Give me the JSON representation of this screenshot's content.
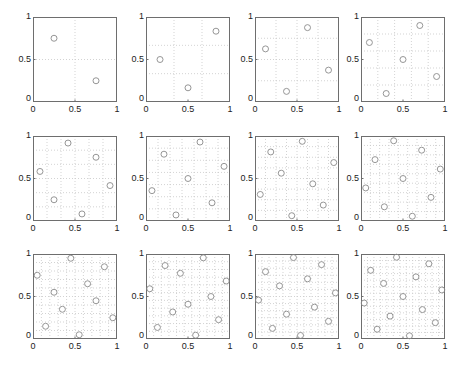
{
  "chart_data": [
    {
      "type": "scatter",
      "n": 2,
      "xlim": [
        0,
        1
      ],
      "ylim": [
        0,
        1
      ],
      "grid": true,
      "xticks": [
        "0",
        "0.5",
        "1"
      ],
      "yticks": [
        "0",
        "0.5",
        "1"
      ],
      "points": [
        [
          0.25,
          0.75
        ],
        [
          0.75,
          0.25
        ]
      ]
    },
    {
      "type": "scatter",
      "n": 3,
      "xlim": [
        0,
        1
      ],
      "ylim": [
        0,
        1
      ],
      "grid": true,
      "xticks": [
        "0",
        "0.5",
        "1"
      ],
      "yticks": [
        "0",
        "0.5",
        "1"
      ],
      "points": [
        [
          0.167,
          0.5
        ],
        [
          0.5,
          0.167
        ],
        [
          0.833,
          0.833
        ]
      ]
    },
    {
      "type": "scatter",
      "n": 4,
      "xlim": [
        0,
        1
      ],
      "ylim": [
        0,
        1
      ],
      "grid": true,
      "xticks": [
        "0",
        "0.5",
        "1"
      ],
      "yticks": [
        "0",
        "0.5",
        "1"
      ],
      "points": [
        [
          0.125,
          0.625
        ],
        [
          0.375,
          0.125
        ],
        [
          0.625,
          0.875
        ],
        [
          0.875,
          0.375
        ]
      ]
    },
    {
      "type": "scatter",
      "n": 5,
      "xlim": [
        0,
        1
      ],
      "ylim": [
        0,
        1
      ],
      "grid": true,
      "xticks": [
        "0",
        "0.5",
        "1"
      ],
      "yticks": [
        "0",
        "0.5",
        "1"
      ],
      "points": [
        [
          0.1,
          0.7
        ],
        [
          0.3,
          0.1
        ],
        [
          0.5,
          0.5
        ],
        [
          0.7,
          0.9
        ],
        [
          0.9,
          0.3
        ]
      ]
    },
    {
      "type": "scatter",
      "n": 6,
      "xlim": [
        0,
        1
      ],
      "ylim": [
        0,
        1
      ],
      "grid": true,
      "xticks": [
        "0",
        "0.5",
        "1"
      ],
      "yticks": [
        "0",
        "0.5",
        "1"
      ],
      "points": [
        [
          0.083,
          0.583
        ],
        [
          0.25,
          0.25
        ],
        [
          0.417,
          0.917
        ],
        [
          0.583,
          0.083
        ],
        [
          0.75,
          0.75
        ],
        [
          0.917,
          0.417
        ]
      ]
    },
    {
      "type": "scatter",
      "n": 7,
      "xlim": [
        0,
        1
      ],
      "ylim": [
        0,
        1
      ],
      "grid": true,
      "xticks": [
        "0",
        "0.5",
        "1"
      ],
      "yticks": [
        "0",
        "0.5",
        "1"
      ],
      "points": [
        [
          0.071,
          0.357
        ],
        [
          0.214,
          0.786
        ],
        [
          0.357,
          0.071
        ],
        [
          0.5,
          0.5
        ],
        [
          0.643,
          0.929
        ],
        [
          0.786,
          0.214
        ],
        [
          0.929,
          0.643
        ]
      ]
    },
    {
      "type": "scatter",
      "n": 8,
      "xlim": [
        0,
        1
      ],
      "ylim": [
        0,
        1
      ],
      "grid": true,
      "xticks": [
        "0",
        "0.5",
        "1"
      ],
      "yticks": [
        "0",
        "0.5",
        "1"
      ],
      "points": [
        [
          0.0625,
          0.3125
        ],
        [
          0.1875,
          0.8125
        ],
        [
          0.3125,
          0.5625
        ],
        [
          0.4375,
          0.0625
        ],
        [
          0.5625,
          0.9375
        ],
        [
          0.6875,
          0.4375
        ],
        [
          0.8125,
          0.1875
        ],
        [
          0.9375,
          0.6875
        ]
      ]
    },
    {
      "type": "scatter",
      "n": 9,
      "xlim": [
        0,
        1
      ],
      "ylim": [
        0,
        1
      ],
      "grid": true,
      "xticks": [
        "0",
        "0.5",
        "1"
      ],
      "yticks": [
        "0",
        "0.5",
        "1"
      ],
      "points": [
        [
          0.056,
          0.389
        ],
        [
          0.167,
          0.722
        ],
        [
          0.278,
          0.167
        ],
        [
          0.389,
          0.944
        ],
        [
          0.5,
          0.5
        ],
        [
          0.611,
          0.056
        ],
        [
          0.722,
          0.833
        ],
        [
          0.833,
          0.278
        ],
        [
          0.944,
          0.611
        ]
      ]
    },
    {
      "type": "scatter",
      "n": 10,
      "xlim": [
        0,
        1
      ],
      "ylim": [
        0,
        1
      ],
      "grid": true,
      "xticks": [
        "0",
        "0.5",
        "1"
      ],
      "yticks": [
        "0",
        "0.5",
        "1"
      ],
      "points": [
        [
          0.05,
          0.75
        ],
        [
          0.15,
          0.15
        ],
        [
          0.25,
          0.55
        ],
        [
          0.35,
          0.35
        ],
        [
          0.45,
          0.95
        ],
        [
          0.55,
          0.05
        ],
        [
          0.65,
          0.65
        ],
        [
          0.75,
          0.45
        ],
        [
          0.85,
          0.85
        ],
        [
          0.95,
          0.25
        ]
      ]
    },
    {
      "type": "scatter",
      "n": 11,
      "xlim": [
        0,
        1
      ],
      "ylim": [
        0,
        1
      ],
      "grid": true,
      "xticks": [
        "0",
        "0.5",
        "1"
      ],
      "yticks": [
        "0",
        "0.5",
        "1"
      ],
      "points": [
        [
          0.045,
          0.591
        ],
        [
          0.136,
          0.136
        ],
        [
          0.227,
          0.864
        ],
        [
          0.318,
          0.318
        ],
        [
          0.409,
          0.773
        ],
        [
          0.5,
          0.409
        ],
        [
          0.591,
          0.045
        ],
        [
          0.682,
          0.955
        ],
        [
          0.773,
          0.5
        ],
        [
          0.864,
          0.227
        ],
        [
          0.955,
          0.682
        ]
      ]
    },
    {
      "type": "scatter",
      "n": 12,
      "xlim": [
        0,
        1
      ],
      "ylim": [
        0,
        1
      ],
      "grid": true,
      "xticks": [
        "0",
        "0.5",
        "1"
      ],
      "yticks": [
        "0",
        "0.5",
        "1"
      ],
      "points": [
        [
          0.042,
          0.458
        ],
        [
          0.125,
          0.792
        ],
        [
          0.208,
          0.125
        ],
        [
          0.292,
          0.625
        ],
        [
          0.375,
          0.292
        ],
        [
          0.458,
          0.958
        ],
        [
          0.542,
          0.042
        ],
        [
          0.625,
          0.708
        ],
        [
          0.708,
          0.375
        ],
        [
          0.792,
          0.875
        ],
        [
          0.875,
          0.208
        ],
        [
          0.958,
          0.542
        ]
      ]
    },
    {
      "type": "scatter",
      "n": 13,
      "xlim": [
        0,
        1
      ],
      "ylim": [
        0,
        1
      ],
      "grid": true,
      "xticks": [
        "0",
        "0.5",
        "1"
      ],
      "yticks": [
        "0",
        "0.5",
        "1"
      ],
      "points": [
        [
          0.038,
          0.423
        ],
        [
          0.115,
          0.808
        ],
        [
          0.192,
          0.115
        ],
        [
          0.269,
          0.654
        ],
        [
          0.346,
          0.269
        ],
        [
          0.423,
          0.962
        ],
        [
          0.5,
          0.5
        ],
        [
          0.577,
          0.038
        ],
        [
          0.654,
          0.731
        ],
        [
          0.731,
          0.346
        ],
        [
          0.808,
          0.885
        ],
        [
          0.885,
          0.192
        ],
        [
          0.962,
          0.577
        ]
      ]
    }
  ],
  "style": {
    "axis_color": "#6e6e6e",
    "grid_color": "#c8c8c8",
    "marker_color": "#8a8a8a",
    "text_color": "#222222"
  },
  "layout": {
    "col_x": [
      33,
      146,
      255,
      361
    ],
    "row_y": [
      17,
      136,
      254
    ],
    "panel_w": 84,
    "panel_h": 85
  }
}
